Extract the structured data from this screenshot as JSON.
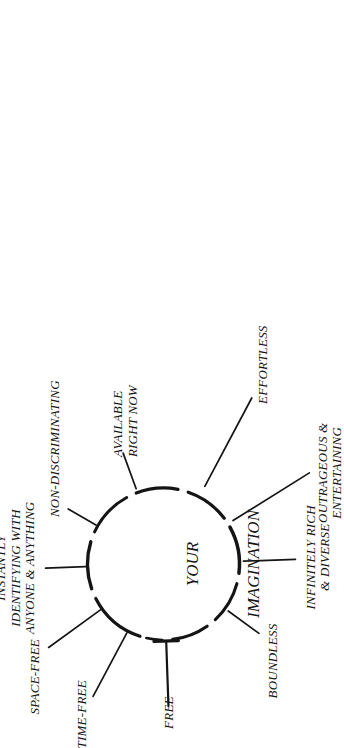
{
  "diagram": {
    "kind": "radial-burst-diagram",
    "orientation": "rotated-90-counterclockwise",
    "background_color": "#ffffff",
    "ink_color": "#141414",
    "center": {
      "line1": "YOUR",
      "line2": "IMAGINATION",
      "font_size_px": 17,
      "circle": {
        "cx": 164,
        "cy": 163,
        "r": 76,
        "style": "hand-drawn-dashed"
      }
    },
    "spokes": [
      {
        "id": "time-free",
        "label": "TIME-FREE",
        "lines": [
          "TIME-FREE"
        ],
        "angle_deg": 208,
        "font_size_px": 13
      },
      {
        "id": "space-free",
        "label": "SPACE-FREE",
        "lines": [
          "SPACE-FREE"
        ],
        "angle_deg": 234,
        "font_size_px": 13
      },
      {
        "id": "instantly-identifying",
        "label": "INSTANTLY IDENTIFYING WITH ANYONE & ANYTHING",
        "lines": [
          "INSTANTLY",
          "IDENTIFYING WITH",
          "ANYONE & ANYTHING"
        ],
        "angle_deg": 268,
        "font_size_px": 13
      },
      {
        "id": "non-discriminating",
        "label": "NON-DISCRIMINATING",
        "lines": [
          "NON-DISCRIMINATING"
        ],
        "angle_deg": 300,
        "font_size_px": 13
      },
      {
        "id": "available-right-now",
        "label": "AVAILABLE RIGHT NOW",
        "lines": [
          "AVAILABLE",
          "RIGHT NOW"
        ],
        "angle_deg": 340,
        "font_size_px": 13
      },
      {
        "id": "effortless",
        "label": "EFFORTLESS",
        "lines": [
          "EFFORTLESS"
        ],
        "angle_deg": 28,
        "font_size_px": 13
      },
      {
        "id": "outrageous-entertaining",
        "label": "OUTRAGEOUS & ENTERTAINING",
        "lines": [
          "OUTRAGEOUS &",
          "ENTERTAINING"
        ],
        "angle_deg": 58,
        "font_size_px": 13
      },
      {
        "id": "infinitely-rich-diverse",
        "label": "INFINITELY RICH & DIVERSE",
        "lines": [
          "INFINITELY RICH",
          "& DIVERSE"
        ],
        "angle_deg": 88,
        "font_size_px": 13
      },
      {
        "id": "boundless",
        "label": "BOUNDLESS",
        "lines": [
          "BOUNDLESS"
        ],
        "angle_deg": 126,
        "font_size_px": 13
      },
      {
        "id": "free",
        "label": "FREE",
        "lines": [
          "FREE"
        ],
        "angle_deg": 178,
        "font_size_px": 13
      }
    ]
  }
}
